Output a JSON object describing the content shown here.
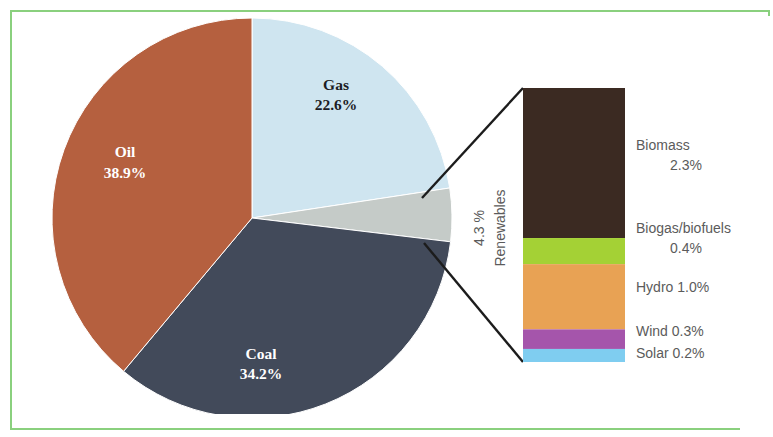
{
  "chart_data": {
    "type": "pie",
    "title": "",
    "subtitle": "",
    "xlabel": "",
    "ylabel": "",
    "legend_position": "inline-labels",
    "grid": false,
    "categories": [
      "Gas",
      "Renewables",
      "Coal",
      "Oil"
    ],
    "values": [
      22.6,
      4.3,
      34.2,
      38.9
    ],
    "unit": "%",
    "slices": [
      {
        "name": "Gas",
        "label": "Gas",
        "value_label": "22.6%",
        "value": 22.6,
        "color": "#cfe5f0",
        "label_color": "#1c1c24",
        "start_angle": 0,
        "end_angle": 81.36,
        "label_x": 336,
        "label_y": 90,
        "value_x": 336,
        "value_y": 110
      },
      {
        "name": "Renewables",
        "label": "",
        "value_label": "",
        "value": 4.3,
        "color": "#c5cbc8",
        "label_color": "#5b5b5b",
        "start_angle": 81.36,
        "end_angle": 96.84,
        "label_x": 0,
        "label_y": 0,
        "value_x": 0,
        "value_y": 0
      },
      {
        "name": "Coal",
        "label": "Coal",
        "value_label": "34.2%",
        "value": 34.2,
        "color": "#424a5a",
        "label_color": "#ffffff",
        "start_angle": 96.84,
        "end_angle": 219.96,
        "label_x": 261,
        "label_y": 359,
        "value_x": 261,
        "value_y": 379
      },
      {
        "name": "Oil",
        "label": "Oil",
        "value_label": "38.9%",
        "value": 38.9,
        "color": "#b5603f",
        "label_color": "#ffffff",
        "start_angle": 219.96,
        "end_angle": 360,
        "label_x": 125,
        "label_y": 157,
        "value_x": 125,
        "value_y": 178
      }
    ],
    "breakout": {
      "type": "stacked-bar",
      "parent_slice": "Renewables",
      "callout_value": "4.3 %",
      "callout_name": "Renewables",
      "total": 4.3,
      "segments": [
        {
          "name": "Biomass",
          "label": "Biomass",
          "value_label": "2.3%",
          "value": 2.3,
          "color": "#3b2a22",
          "label_line_1": "Biomass",
          "label_line_2": "2.3%"
        },
        {
          "name": "Biogas/biofuels",
          "label": "Biogas/biofuels",
          "value_label": "0.4%",
          "value": 0.4,
          "color": "#a4d135",
          "label_line_1": "Biogas/biofuels",
          "label_line_2": "0.4%"
        },
        {
          "name": "Hydro",
          "label": "Hydro 1.0%",
          "value_label": "1.0%",
          "value": 1.0,
          "color": "#e8a254",
          "label_line_1": "Hydro 1.0%",
          "label_line_2": ""
        },
        {
          "name": "Wind",
          "label": "Wind 0.3%",
          "value_label": "0.3%",
          "value": 0.3,
          "color": "#a555ab",
          "label_line_1": "Wind 0.3%",
          "label_line_2": ""
        },
        {
          "name": "Solar",
          "label": "Solar 0.2%",
          "value_label": "0.2%",
          "value": 0.2,
          "color": "#7fcdf0",
          "label_line_1": "Solar 0.2%",
          "label_line_2": ""
        }
      ]
    }
  },
  "geometry": {
    "pie": {
      "cx": 252,
      "cy": 218,
      "r": 200
    },
    "bar": {
      "x": 523,
      "y": 88,
      "width": 102,
      "height": 274
    },
    "callout": {
      "line_top": {
        "x1": 422,
        "y1": 198,
        "x2": 523,
        "y2": 88
      },
      "line_bottom": {
        "x1": 424,
        "y1": 243,
        "x2": 523,
        "y2": 362
      }
    },
    "labels": {
      "callout_value_x": 484,
      "callout_value_y": 228,
      "callout_name_x": 505,
      "callout_name_y": 228,
      "bar_label_x": 636,
      "biomass_y1": 150,
      "biomass_y2": 170,
      "biogas_y1": 233,
      "biogas_y2": 253,
      "hydro_y": 292,
      "wind_y": 336,
      "solar_y": 358
    }
  },
  "frame": {
    "border_color": "#8ad07e"
  }
}
